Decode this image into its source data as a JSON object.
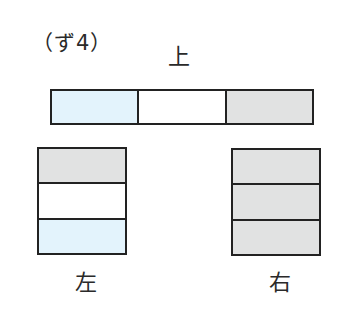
{
  "title": "（ず4）",
  "colors": {
    "blue": "#e3f3fc",
    "white": "#ffffff",
    "gray": "#e1e2e2",
    "border": "#222222"
  },
  "top": {
    "label": "上",
    "cells": [
      "blue",
      "white",
      "gray"
    ]
  },
  "left": {
    "label": "左",
    "cells": [
      "gray",
      "white",
      "blue"
    ]
  },
  "right": {
    "label": "右",
    "cells": [
      "gray",
      "gray",
      "gray"
    ]
  }
}
